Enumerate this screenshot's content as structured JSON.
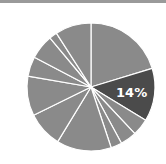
{
  "chart_data": {
    "type": "pie",
    "title": "",
    "start_angle_deg": 0,
    "direction": "clockwise",
    "center": [
      91,
      87
    ],
    "radius": 64,
    "slice_colors": {
      "default": "#8a8a8a",
      "highlight": "#4b4b4b",
      "separator": "#ffffff"
    },
    "slices": [
      {
        "value": 20.3,
        "highlight": false,
        "label": ""
      },
      {
        "value": 13.4,
        "highlight": true,
        "label": "14%"
      },
      {
        "value": 4.3,
        "highlight": false,
        "label": ""
      },
      {
        "value": 4.1,
        "highlight": false,
        "label": ""
      },
      {
        "value": 2.8,
        "highlight": false,
        "label": ""
      },
      {
        "value": 13.8,
        "highlight": false,
        "label": ""
      },
      {
        "value": 9.0,
        "highlight": false,
        "label": ""
      },
      {
        "value": 10.0,
        "highlight": false,
        "label": ""
      },
      {
        "value": 5.0,
        "highlight": false,
        "label": ""
      },
      {
        "value": 6.2,
        "highlight": false,
        "label": ""
      },
      {
        "value": 2.0,
        "highlight": false,
        "label": ""
      },
      {
        "value": 9.1,
        "highlight": false,
        "label": ""
      }
    ],
    "annotations": [
      "14%"
    ],
    "legend": null
  }
}
